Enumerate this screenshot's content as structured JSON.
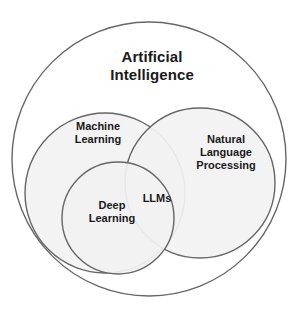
{
  "diagram": {
    "type": "venn",
    "background_color": "#ffffff",
    "stroke_color": "#666666",
    "fill_color": "#f2f2f2",
    "text_color": "#1a1a1a",
    "sets": [
      {
        "id": "artificial-intelligence",
        "label": "Artificial\nIntelligence",
        "label_line_1": "Artificial",
        "label_line_2": "Intelligence",
        "cx": 149,
        "cy": 159,
        "r": 137,
        "filled": false,
        "fill": "#ffffff",
        "stroke": "#666666"
      },
      {
        "id": "machine-learning",
        "label": "Machine\nLearning",
        "label_line_1": "Machine",
        "label_line_2": "Learning",
        "cx": 105,
        "cy": 193,
        "r": 80,
        "filled": true,
        "fill": "#f2f2f2",
        "stroke": "#666666"
      },
      {
        "id": "natural-language-processing",
        "label": "Natural\nLanguage\nProcessing",
        "label_line_1": "Natural",
        "label_line_2": "Language",
        "label_line_3": "Processing",
        "cx": 200,
        "cy": 183,
        "r": 75,
        "filled": true,
        "fill": "#f2f2f2",
        "stroke": "#666666"
      },
      {
        "id": "deep-learning",
        "label": "Deep\nLearning",
        "label_line_1": "Deep",
        "label_line_2": "Learning",
        "cx": 118,
        "cy": 218,
        "r": 56,
        "filled": true,
        "fill": "#f2f2f2",
        "stroke": "#666666"
      }
    ],
    "intersections": [
      {
        "id": "llms",
        "label": "LLMs",
        "members": [
          "deep-learning",
          "natural-language-processing"
        ]
      }
    ]
  }
}
